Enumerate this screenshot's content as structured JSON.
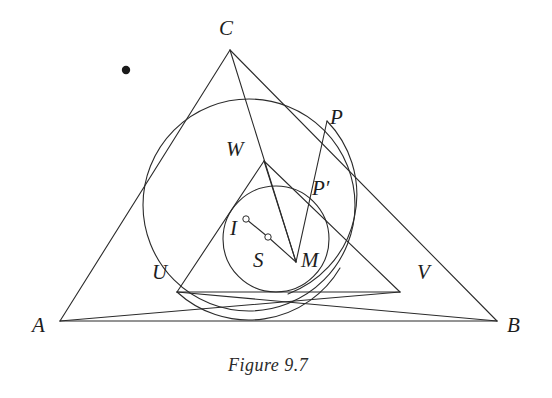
{
  "figure": {
    "caption": "Figure 9.7",
    "caption_pos": {
      "x": 228,
      "y": 355
    },
    "background": "#ffffff",
    "stroke_color": "#2b2b2b",
    "stroke_width": 1.1,
    "label_color": "#1d1d1d",
    "width": 552,
    "height": 398
  },
  "geometry": {
    "points": [
      {
        "name": "A",
        "x": 60,
        "y": 321,
        "label": "A",
        "label_x": 32,
        "label_y": 315,
        "marker": "vertex"
      },
      {
        "name": "B",
        "x": 497,
        "y": 321,
        "label": "B",
        "label_x": 507,
        "label_y": 315,
        "marker": "vertex"
      },
      {
        "name": "C",
        "x": 230,
        "y": 50,
        "label": "C",
        "label_x": 219,
        "label_y": 18,
        "marker": "vertex"
      },
      {
        "name": "U",
        "x": 177,
        "y": 292,
        "label": "U",
        "label_x": 152,
        "label_y": 262,
        "marker": "none"
      },
      {
        "name": "V",
        "x": 400,
        "y": 292,
        "label": "V",
        "label_x": 417,
        "label_y": 262,
        "marker": "none"
      },
      {
        "name": "W",
        "x": 264,
        "y": 161,
        "label": "W",
        "label_x": 226,
        "label_y": 139,
        "marker": "none"
      },
      {
        "name": "M",
        "x": 296,
        "y": 262,
        "label": "M",
        "label_x": 301,
        "label_y": 250,
        "marker": "none"
      },
      {
        "name": "P",
        "x": 327,
        "y": 121,
        "label": "P",
        "label_x": 330,
        "label_y": 107,
        "marker": "none"
      },
      {
        "name": "Pprime",
        "x": 309,
        "y": 199,
        "label": "P′",
        "label_x": 312,
        "label_y": 178,
        "marker": "none"
      },
      {
        "name": "I",
        "x": 246,
        "y": 219,
        "label": "I",
        "label_x": 230,
        "label_y": 218,
        "marker": "hollow-dot"
      },
      {
        "name": "S",
        "x": 268,
        "y": 237,
        "label": "S",
        "label_x": 253,
        "label_y": 250,
        "marker": "hollow-dot"
      }
    ],
    "stray_dot": {
      "name": "stray-dot",
      "x": 126,
      "y": 70,
      "radius": 4.2
    },
    "circles": [
      {
        "name": "incircle",
        "cx": 249,
        "cy": 205,
        "r": 106
      },
      {
        "name": "inner-circle",
        "cx": 276,
        "cy": 239,
        "r": 53
      }
    ],
    "arcs": [
      {
        "name": "arc-through-P-M",
        "d": "M 327 121 A 106 106 0 0 1 288 294"
      },
      {
        "name": "arc-lower-left",
        "d": "M 177 292 A 106 106 0 0 0 340 268"
      }
    ],
    "segments": [
      {
        "name": "side-AB",
        "from": "A",
        "to": "B"
      },
      {
        "name": "side-AC",
        "from": "A",
        "to": "C"
      },
      {
        "name": "side-BC",
        "from": "B",
        "to": "C"
      },
      {
        "name": "cevian-A-to-V",
        "from": "A",
        "to": "V"
      },
      {
        "name": "cevian-B-to-U",
        "from": "B",
        "to": "U"
      },
      {
        "name": "cevian-C-to-M",
        "from": "C",
        "to": "M"
      },
      {
        "name": "segment-U-to-V",
        "from": "U",
        "to": "V"
      },
      {
        "name": "segment-U-to-W",
        "from": "U",
        "to": "W"
      },
      {
        "name": "segment-W-to-M",
        "from": "W",
        "to": "M"
      },
      {
        "name": "segment-W-to-V",
        "from": "W",
        "to": "V"
      },
      {
        "name": "segment-P-to-M",
        "from": "P",
        "to": "M"
      },
      {
        "name": "segment-I-to-S",
        "from": "I",
        "to": "S"
      },
      {
        "name": "segment-S-to-M",
        "from": "S",
        "to": "M"
      }
    ]
  }
}
